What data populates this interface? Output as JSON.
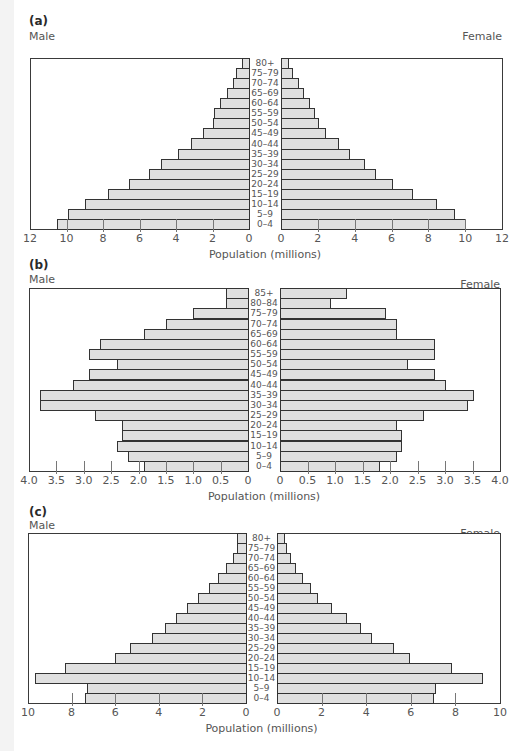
{
  "chart_data": [
    {
      "type": "bar",
      "subtype": "population-pyramid",
      "panel": "(a)",
      "title": "",
      "xlabel": "Population (millions)",
      "left_label": "Male",
      "right_label": "Female",
      "categories": [
        "80+",
        "75–79",
        "70–74",
        "65–69",
        "60–64",
        "55–59",
        "50–54",
        "45–49",
        "40–44",
        "35–39",
        "30–34",
        "25–29",
        "20–24",
        "15–19",
        "10–14",
        "5–9",
        "0–4"
      ],
      "series": [
        {
          "name": "Male",
          "values": [
            0.4,
            0.7,
            0.9,
            1.2,
            1.6,
            1.9,
            2.0,
            2.5,
            3.2,
            3.9,
            4.8,
            5.5,
            6.6,
            7.7,
            9.0,
            9.9,
            10.5
          ]
        },
        {
          "name": "Female",
          "values": [
            0.4,
            0.6,
            0.9,
            1.2,
            1.5,
            1.8,
            2.0,
            2.4,
            3.1,
            3.7,
            4.5,
            5.1,
            6.0,
            7.1,
            8.4,
            9.4,
            10.0
          ]
        }
      ],
      "xlim": [
        0,
        12
      ],
      "ticks": [
        "12",
        "10",
        "8",
        "6",
        "4",
        "2",
        "0",
        "0",
        "2",
        "4",
        "6",
        "8",
        "10",
        "12"
      ],
      "grid": false
    },
    {
      "type": "bar",
      "subtype": "population-pyramid",
      "panel": "(b)",
      "title": "",
      "xlabel": "Population (millions)",
      "left_label": "Male",
      "right_label": "Female",
      "categories": [
        "85+",
        "80–84",
        "75–79",
        "70–74",
        "65–69",
        "60–64",
        "55–59",
        "50–54",
        "45–49",
        "40–44",
        "35–39",
        "30–34",
        "25–29",
        "20–24",
        "15–19",
        "10–14",
        "5–9",
        "0–4"
      ],
      "series": [
        {
          "name": "Male",
          "values": [
            0.4,
            0.4,
            1.0,
            1.5,
            1.9,
            2.7,
            2.9,
            2.4,
            2.9,
            3.2,
            3.8,
            3.8,
            2.8,
            2.3,
            2.3,
            2.4,
            2.2,
            1.9
          ]
        },
        {
          "name": "Female",
          "values": [
            1.2,
            0.9,
            1.9,
            2.1,
            2.1,
            2.8,
            2.8,
            2.3,
            2.8,
            3.0,
            3.5,
            3.4,
            2.6,
            2.1,
            2.2,
            2.2,
            2.1,
            1.8
          ]
        }
      ],
      "xlim": [
        0,
        4.0
      ],
      "ticks": [
        "4.0",
        "3.5",
        "3.0",
        "2.5",
        "2.0",
        "1.5",
        "1.0",
        "0.5",
        "0",
        "0",
        "0.5",
        "1.0",
        "1.5",
        "2.0",
        "2.5",
        "3.0",
        "3.5",
        "4.0"
      ],
      "grid": false
    },
    {
      "type": "bar",
      "subtype": "population-pyramid",
      "panel": "(c)",
      "title": "",
      "xlabel": "Population (millions)",
      "left_label": "Male",
      "right_label": "Female",
      "categories": [
        "80+",
        "75–79",
        "70–74",
        "65–69",
        "60–64",
        "55–59",
        "50–54",
        "45–49",
        "40–44",
        "35–39",
        "30–34",
        "25–29",
        "20–24",
        "15–19",
        "10–14",
        "5–9",
        "0–4"
      ],
      "series": [
        {
          "name": "Male",
          "values": [
            0.4,
            0.4,
            0.6,
            0.9,
            1.3,
            1.7,
            2.2,
            2.7,
            3.2,
            3.7,
            4.3,
            5.3,
            6.0,
            8.3,
            9.7,
            7.3,
            7.4
          ]
        },
        {
          "name": "Female",
          "values": [
            0.3,
            0.4,
            0.6,
            0.8,
            1.1,
            1.5,
            1.8,
            2.4,
            3.1,
            3.7,
            4.2,
            5.2,
            5.9,
            7.8,
            9.2,
            7.1,
            7.0
          ]
        }
      ],
      "xlim": [
        0,
        10
      ],
      "ticks": [
        "10",
        "8",
        "6",
        "4",
        "2",
        "0",
        "0",
        "2",
        "4",
        "6",
        "8",
        "10"
      ],
      "grid": false
    }
  ],
  "panels": [
    {
      "label": "(a)",
      "male": "Male",
      "female": "Female",
      "xlabel": "Population (millions)"
    },
    {
      "label": "(b)",
      "male": "Male",
      "female": "Female",
      "xlabel": "Population (millions)"
    },
    {
      "label": "(c)",
      "male": "Male",
      "female": "Female",
      "xlabel": "Population (millions)"
    }
  ],
  "colors": {
    "bar_fill": "#e0e0e0",
    "bar_stroke": "#333333",
    "frame": "#3a3a3a",
    "text": "#555555"
  }
}
